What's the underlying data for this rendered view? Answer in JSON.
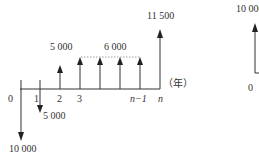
{
  "diagram": {
    "type": "cash-flow-diagram",
    "axis_unit_label": "（年）",
    "ticks": [
      {
        "label": "0",
        "italic": false
      },
      {
        "label": "1",
        "italic": false
      },
      {
        "label": "2",
        "italic": false
      },
      {
        "label": "3",
        "italic": false
      },
      {
        "label": "n−1",
        "italic": true
      },
      {
        "label": "n",
        "italic": true
      }
    ],
    "flows": [
      {
        "period": "0",
        "direction": "out",
        "amount": "10 000"
      },
      {
        "period": "1",
        "direction": "out",
        "amount": "5 000"
      },
      {
        "period": "2",
        "direction": "in",
        "amount": "5 000"
      },
      {
        "period": "3 to n−1",
        "direction": "in",
        "amount": "6 000"
      },
      {
        "period": "n",
        "direction": "in",
        "amount": "11 500"
      }
    ],
    "labels": {
      "out_0": "10 000",
      "out_1": "5 000",
      "in_2": "5 000",
      "in_range": "6 000",
      "in_n": "11 500"
    }
  },
  "partial_diagram": {
    "amount": "10 000",
    "tick0": "0"
  }
}
